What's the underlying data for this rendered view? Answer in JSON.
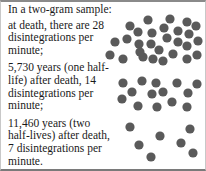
{
  "caption": {
    "intro": "In a two-gram sample:",
    "paragraphs": [
      "at death, there are 28 disintegrations per minute;",
      "5,730 years (one half-life) after death, 14 disintegrations per minute;",
      "11,460 years (two half-lives) after death, 7 disintegrations per minute."
    ]
  },
  "colors": {
    "dot": "#5a5a5a",
    "text": "#1a1a1a",
    "border": "#8a8a8a"
  },
  "clusters": [
    {
      "label": "at death",
      "count": 28,
      "dots": [
        [
          148,
          20
        ],
        [
          170,
          19
        ],
        [
          187,
          22
        ],
        [
          130,
          26
        ],
        [
          196,
          26
        ],
        [
          138,
          32
        ],
        [
          152,
          33
        ],
        [
          164,
          28
        ],
        [
          178,
          31
        ],
        [
          189,
          34
        ],
        [
          115,
          42
        ],
        [
          127,
          39
        ],
        [
          139,
          44
        ],
        [
          151,
          44
        ],
        [
          167,
          38
        ],
        [
          178,
          42
        ],
        [
          187,
          46
        ],
        [
          198,
          41
        ],
        [
          110,
          55
        ],
        [
          123,
          59
        ],
        [
          143,
          57
        ],
        [
          153,
          59
        ],
        [
          163,
          61
        ],
        [
          173,
          54
        ],
        [
          187,
          59
        ],
        [
          197,
          55
        ],
        [
          140,
          52
        ],
        [
          159,
          50
        ]
      ]
    },
    {
      "label": "one half-life",
      "count": 14,
      "dots": [
        [
          123,
          83
        ],
        [
          142,
          81
        ],
        [
          156,
          83
        ],
        [
          177,
          83
        ],
        [
          197,
          84
        ],
        [
          132,
          92
        ],
        [
          152,
          94
        ],
        [
          163,
          92
        ],
        [
          188,
          93
        ],
        [
          122,
          99
        ],
        [
          138,
          106
        ],
        [
          157,
          107
        ],
        [
          172,
          102
        ],
        [
          187,
          107
        ]
      ]
    },
    {
      "label": "two half-lives",
      "count": 7,
      "dots": [
        [
          130,
          127
        ],
        [
          160,
          136
        ],
        [
          190,
          129
        ],
        [
          139,
          145
        ],
        [
          181,
          143
        ],
        [
          151,
          157
        ],
        [
          193,
          153
        ]
      ]
    }
  ]
}
